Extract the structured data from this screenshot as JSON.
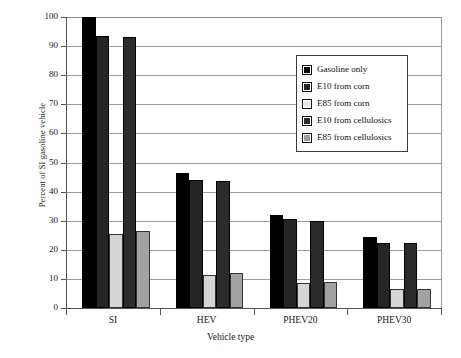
{
  "chart_data": {
    "type": "bar",
    "title": "",
    "xlabel": "Vehicle type",
    "ylabel": "Percent of SI gasoline vehicle",
    "categories": [
      "SI",
      "HEV",
      "PHEV20",
      "PHEV30"
    ],
    "ylim": [
      0,
      100
    ],
    "yticks": [
      0,
      10,
      20,
      30,
      40,
      50,
      60,
      70,
      80,
      90,
      100
    ],
    "ytick_labels": [
      "0",
      "10",
      "20",
      "30",
      "40",
      "50",
      "60",
      "70",
      "80",
      "90",
      "100"
    ],
    "grid": true,
    "legend_position": "upper right",
    "series": [
      {
        "name": "Gasoline only",
        "color": "#000000",
        "values": [
          100.0,
          46.5,
          32.0,
          24.5
        ]
      },
      {
        "name": "E10 from corn",
        "color": "#252525",
        "values": [
          93.5,
          44.0,
          30.5,
          22.5
        ]
      },
      {
        "name": "E85 from corn",
        "color": "#d5d5d5",
        "values": [
          25.5,
          11.5,
          8.5,
          6.5
        ]
      },
      {
        "name": "E10 from cellulosics",
        "color": "#2b2b2b",
        "values": [
          93.0,
          43.5,
          30.0,
          22.5
        ]
      },
      {
        "name": "E85 from cellulosics",
        "color": "#a2a2a2",
        "values": [
          26.5,
          12.0,
          9.0,
          6.5
        ]
      }
    ]
  }
}
